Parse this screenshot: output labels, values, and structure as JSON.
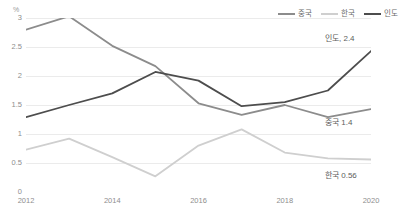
{
  "chart_data": {
    "type": "line",
    "title": "",
    "subtitle": "",
    "xlabel": "",
    "ylabel": "",
    "unit_label": "%",
    "x": [
      2012,
      2013,
      2014,
      2015,
      2016,
      2017,
      2018,
      2019,
      2020
    ],
    "xtick_labels": [
      "2012",
      "2014",
      "2016",
      "2018",
      "2020"
    ],
    "xtick_values": [
      2012,
      2014,
      2016,
      2018,
      2020
    ],
    "xlim": [
      2012,
      2020
    ],
    "ylim": [
      0,
      3
    ],
    "ytick_labels": [
      "3",
      "2.5",
      "2",
      "1.5",
      "1",
      "0.5",
      "0"
    ],
    "ytick_values": [
      3,
      2.5,
      2,
      1.5,
      1,
      0.5,
      0
    ],
    "grid": true,
    "grid_axis": "y",
    "legend_position": "top-right",
    "series": [
      {
        "name": "중국",
        "color": "#8c8c8c",
        "values": [
          2.8,
          3.03,
          2.52,
          2.17,
          1.53,
          1.33,
          1.5,
          1.29,
          1.43
        ]
      },
      {
        "name": "한국",
        "color": "#cfcfcf",
        "values": [
          0.73,
          0.92,
          0.6,
          0.27,
          0.8,
          1.08,
          0.68,
          0.58,
          0.56
        ]
      },
      {
        "name": "인도",
        "color": "#4d4d4d",
        "values": [
          1.29,
          1.5,
          1.7,
          2.07,
          1.92,
          1.48,
          1.55,
          1.75,
          2.43
        ]
      }
    ],
    "annotations": [
      {
        "text": "인도, 2.4",
        "series": "인도",
        "x": 2020,
        "y": 2.43
      },
      {
        "text": "중국 1.4",
        "series": "중국",
        "x": 2020,
        "y": 1.43
      },
      {
        "text": "한국 0.56",
        "series": "한국",
        "x": 2020,
        "y": 0.56
      }
    ]
  },
  "legend": {
    "entries": [
      {
        "label": "중국",
        "color": "#8c8c8c"
      },
      {
        "label": "한국",
        "color": "#cfcfcf"
      },
      {
        "label": "인도",
        "color": "#4d4d4d"
      }
    ]
  },
  "style": {
    "grid_color": "#ebebeb",
    "axis_color": "#d9d9d9",
    "tick_text_color": "#8e8e8e",
    "background": "#ffffff"
  }
}
